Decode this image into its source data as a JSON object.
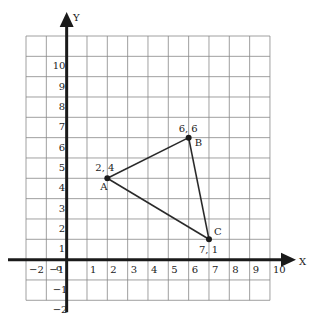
{
  "diagram": {
    "type": "coordinate-plane-triangle",
    "axes": {
      "x_label": "X",
      "y_label": "Y",
      "origin_label": "o",
      "x_ticks": [
        -2,
        -1,
        1,
        2,
        3,
        4,
        5,
        6,
        7,
        8,
        9,
        10
      ],
      "y_ticks": [
        10,
        9,
        8,
        7,
        6,
        5,
        4,
        3,
        2,
        1,
        -1,
        -2
      ],
      "x_range": [
        -2,
        10
      ],
      "y_range": [
        -2,
        11
      ]
    },
    "grid": {
      "shown": true,
      "color": "#888888"
    },
    "colors": {
      "axis": "#1a1a1a",
      "line": "#2a2a2a",
      "point": "#1a1a1a"
    },
    "points": [
      {
        "name": "A",
        "x": 2,
        "y": 4,
        "coord_label": "2, 4"
      },
      {
        "name": "B",
        "x": 6,
        "y": 6,
        "coord_label": "6, 6"
      },
      {
        "name": "C",
        "x": 7,
        "y": 1,
        "coord_label": "7, 1"
      }
    ],
    "segments": [
      [
        "A",
        "B"
      ],
      [
        "B",
        "C"
      ],
      [
        "A",
        "C"
      ]
    ]
  }
}
